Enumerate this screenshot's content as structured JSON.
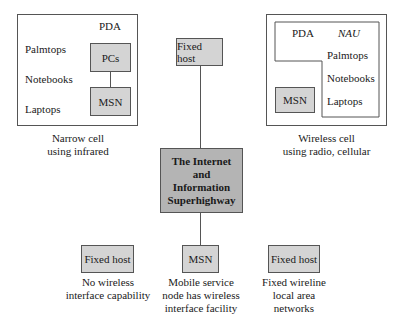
{
  "narrow_cell": {
    "devices": [
      "PDA",
      "Palmtops",
      "Notebooks",
      "Laptops"
    ],
    "pcs": "PCs",
    "msn": "MSN",
    "caption_line1": "Narrow cell",
    "caption_line2": "using infrared"
  },
  "wireless_cell": {
    "pda": "PDA",
    "nau": "NAU",
    "devices": [
      "Palmtops",
      "Notebooks",
      "Laptops"
    ],
    "msn": "MSN",
    "caption_line1": "Wireless cell",
    "caption_line2": "using radio, cellular"
  },
  "top_fixed_host": "Fixed host",
  "internet": {
    "lines": [
      "The Internet",
      "and",
      "Information",
      "Superhighway"
    ]
  },
  "bottom": [
    {
      "label": "Fixed host",
      "caption": [
        "No wireless",
        "interface capability"
      ]
    },
    {
      "label": "MSN",
      "caption": [
        "Mobile service",
        "node has wireless",
        "interface facility"
      ]
    },
    {
      "label": "Fixed host",
      "caption": [
        "Fixed wireline",
        "local area",
        "networks"
      ]
    }
  ]
}
